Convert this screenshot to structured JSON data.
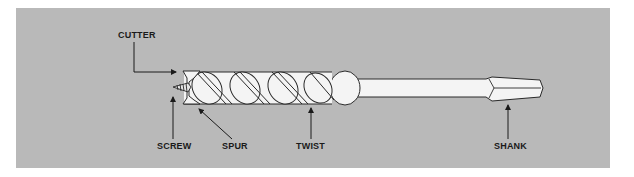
{
  "figure": {
    "background_color": "#b9b9b9",
    "line_color": "#2a2a2a",
    "bit_fill": "#f4f4f4"
  },
  "labels": {
    "cutter": "CUTTER",
    "screw": "SCREW",
    "spur": "SPUR",
    "twist": "TWIST",
    "shank": "SHANK"
  }
}
